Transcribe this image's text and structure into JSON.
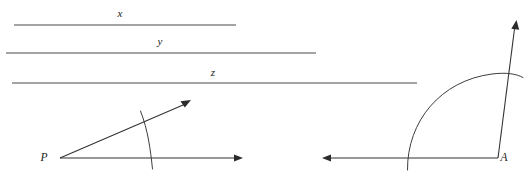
{
  "figure": {
    "background_color": "#ffffff",
    "line_color": "#4a4a4a",
    "label_color": "#1a1a1a",
    "width": 532,
    "height": 176,
    "lines": [
      {
        "id": "line-x",
        "label": "x",
        "label_x": 120,
        "label_y": 17,
        "x1": 14,
        "y1": 25,
        "x2": 236,
        "y2": 25
      },
      {
        "id": "line-y",
        "label": "y",
        "label_x": 160,
        "label_y": 45,
        "x1": 6,
        "y1": 53,
        "x2": 316,
        "y2": 53
      },
      {
        "id": "line-z",
        "label": "z",
        "label_x": 213,
        "label_y": 76,
        "x1": 12,
        "y1": 83,
        "x2": 417,
        "y2": 83
      }
    ],
    "angles": [
      {
        "id": "angle-p",
        "vertex_label": "P",
        "vertex_label_x": 44,
        "vertex_label_y": 161,
        "vertex_x": 60,
        "vertex_y": 158,
        "ray_horizontal_end_x": 243,
        "ray_horizontal_end_y": 158,
        "ray_slanted_end_x": 191,
        "ray_slanted_end_y": 100,
        "arc_radius": 92,
        "arc_path": "M 152,169 C 150,150 148,130 140,111"
      },
      {
        "id": "angle-a",
        "vertex_label": "A",
        "vertex_label_x": 504,
        "vertex_label_y": 161,
        "vertex_x": 498,
        "vertex_y": 158,
        "ray_horizontal_end_x": 322,
        "ray_horizontal_end_y": 158,
        "ray_slanted_end_x": 516,
        "ray_slanted_end_y": 20,
        "arc_radius": 90,
        "arc_path": "M 407,170 C 407,120 440,80 492,74 C 505,72 515,73 523,77"
      }
    ]
  }
}
